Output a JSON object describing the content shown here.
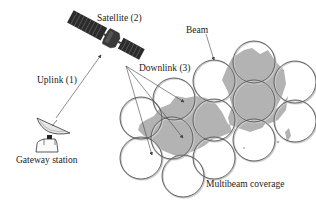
{
  "diagram": {
    "labels": {
      "satellite": "Satellite (2)",
      "uplink": "Uplink (1)",
      "downlink": "Downlink (3)",
      "beam": "Beam",
      "gateway": "Gateway station",
      "coverage": "Multibeam coverage"
    },
    "colors": {
      "land": "#b3b3b3",
      "beam_outline": "#555555",
      "satellite_body": "#3a3a3a",
      "solar_panel": "#2b2b2b",
      "text": "#222222"
    },
    "icons": [
      "satellite-icon",
      "gateway-dish-icon"
    ],
    "beam_count": 13
  }
}
